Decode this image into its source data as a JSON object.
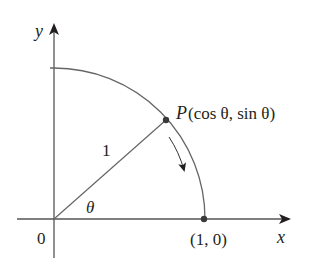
{
  "diagram": {
    "type": "unit-circle-quarter-arc",
    "axes": {
      "x_label": "x",
      "y_label": "y",
      "origin_label": "0"
    },
    "radius_label": "1",
    "angle_label": "θ",
    "point_P": {
      "name": "P",
      "coords_label": "(cos θ, sin θ)"
    },
    "point_on_x_axis": {
      "label": "(1, 0)"
    },
    "arrow_direction": "clockwise along arc toward (1, 0)",
    "colors": {
      "line": "#555555",
      "point": "#3a3a3a",
      "text": "#231f20"
    }
  }
}
